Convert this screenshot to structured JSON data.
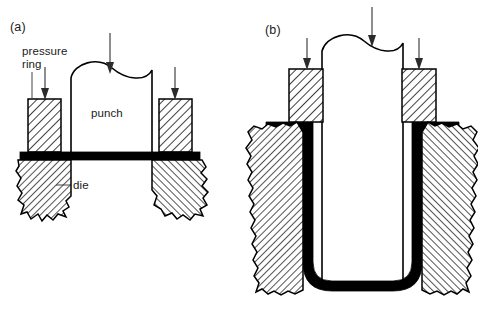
{
  "figure": {
    "panels": [
      {
        "id": "a",
        "label": "(a)",
        "caption_stage": "before drawing",
        "labels": [
          {
            "name": "pressure-ring",
            "text_line1": "pressure",
            "text_line2": "ring"
          },
          {
            "name": "punch",
            "text": "punch"
          },
          {
            "name": "die",
            "text": "die"
          }
        ],
        "arrows": [
          {
            "name": "punch-force-arrow",
            "direction": "down"
          },
          {
            "name": "left-pressure-ring-force-arrow",
            "direction": "down"
          },
          {
            "name": "right-pressure-ring-force-arrow",
            "direction": "down"
          }
        ]
      },
      {
        "id": "b",
        "label": "(b)",
        "caption_stage": "after drawing",
        "labels": [],
        "arrows": [
          {
            "name": "punch-force-arrow",
            "direction": "down"
          },
          {
            "name": "left-pressure-ring-force-arrow",
            "direction": "down"
          },
          {
            "name": "right-pressure-ring-force-arrow",
            "direction": "down"
          }
        ]
      }
    ],
    "colors": {
      "line": "#000000",
      "sheet_metal": "#000000",
      "arrow": "#2b2b2b",
      "hatch": "#000000",
      "background": "#ffffff"
    }
  }
}
